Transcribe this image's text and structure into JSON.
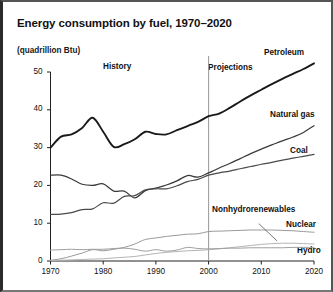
{
  "figure": {
    "title": "Energy consumption by fuel, 1970–2020",
    "units": "(quadrillion Btu)",
    "era_labels": {
      "history": "History",
      "projections": "Projections"
    },
    "series_labels": {
      "petroleum": "Petroleum",
      "natural_gas": "Natural gas",
      "coal": "Coal",
      "nonhydrorenewables": "Nonhydrorenewables",
      "nuclear": "Nuclear",
      "hydro": "Hydro"
    }
  },
  "chart_data": {
    "type": "line",
    "title": "Energy consumption by fuel, 1970–2020",
    "xlabel": "",
    "ylabel": "(quadrillion Btu)",
    "xlim": [
      1970,
      2020
    ],
    "ylim": [
      0,
      50
    ],
    "yticks": [
      0,
      10,
      20,
      30,
      40,
      50
    ],
    "xticks": [
      1970,
      1980,
      1990,
      2000,
      2010,
      2020
    ],
    "grid": false,
    "legend": "inline-right-labels",
    "annotations": [
      {
        "text": "History",
        "x": 1980,
        "y": 46
      },
      {
        "text": "Projections",
        "x": 2004,
        "y": 45.5
      },
      {
        "text": "Nonhydrorenewables",
        "x": 2008,
        "y": 9.5,
        "leader_to": {
          "x": 2013,
          "y": 5.3
        }
      }
    ],
    "divider": {
      "x": 2000,
      "note": "history / projections boundary"
    },
    "x": [
      1970,
      1972,
      1974,
      1976,
      1978,
      1980,
      1982,
      1984,
      1986,
      1988,
      1990,
      1992,
      1994,
      1996,
      1998,
      2000,
      2002,
      2004,
      2006,
      2008,
      2010,
      2012,
      2014,
      2016,
      2018,
      2020
    ],
    "series": [
      {
        "name": "Petroleum",
        "color": "#1a1a1a",
        "values": [
          30.0,
          32.9,
          33.5,
          35.2,
          37.9,
          34.2,
          30.2,
          30.9,
          32.2,
          34.2,
          33.6,
          33.5,
          34.6,
          35.7,
          36.8,
          38.3,
          39.0,
          40.5,
          42.2,
          43.8,
          45.3,
          46.8,
          48.2,
          49.5,
          50.8,
          52.3
        ]
      },
      {
        "name": "Natural gas",
        "color": "#3a3a3a",
        "values": [
          22.7,
          22.7,
          21.7,
          20.3,
          20.0,
          20.4,
          18.5,
          18.5,
          16.7,
          18.6,
          19.3,
          20.1,
          21.2,
          22.6,
          22.2,
          23.3,
          24.6,
          25.8,
          27.1,
          28.4,
          29.6,
          30.7,
          31.8,
          32.8,
          34.0,
          35.8
        ]
      },
      {
        "name": "Coal",
        "color": "#4a4a4a",
        "values": [
          12.3,
          12.4,
          12.8,
          13.6,
          13.8,
          15.4,
          15.3,
          17.1,
          17.3,
          18.8,
          19.1,
          19.1,
          19.9,
          21.0,
          21.6,
          22.7,
          23.3,
          23.8,
          24.4,
          25.0,
          25.6,
          26.1,
          26.7,
          27.2,
          27.7,
          28.2
        ]
      },
      {
        "name": "Nuclear",
        "color": "#9a9a9a",
        "values": [
          0.2,
          0.6,
          1.3,
          2.1,
          3.0,
          2.7,
          3.1,
          3.6,
          4.5,
          5.7,
          6.1,
          6.5,
          6.8,
          7.1,
          7.2,
          7.8,
          7.9,
          8.0,
          8.1,
          8.2,
          8.2,
          8.2,
          8.1,
          8.0,
          7.8,
          7.6
        ]
      },
      {
        "name": "Nonhydrorenewables",
        "color": "#b5b5b5",
        "values": [
          0.1,
          0.2,
          0.3,
          0.4,
          0.5,
          0.6,
          0.8,
          1.0,
          1.2,
          1.6,
          2.0,
          2.3,
          2.5,
          2.7,
          2.8,
          3.0,
          3.2,
          3.5,
          3.8,
          4.1,
          4.4,
          4.6,
          4.7,
          4.7,
          4.6,
          4.5
        ]
      },
      {
        "name": "Hydro",
        "color": "#9f9f9f",
        "values": [
          2.9,
          3.0,
          3.1,
          3.0,
          3.1,
          3.1,
          3.3,
          3.4,
          3.1,
          2.6,
          3.0,
          2.6,
          2.9,
          3.6,
          3.3,
          3.2,
          3.3,
          3.4,
          3.4,
          3.5,
          3.5,
          3.5,
          3.5,
          3.6,
          3.6,
          3.6
        ]
      }
    ]
  }
}
